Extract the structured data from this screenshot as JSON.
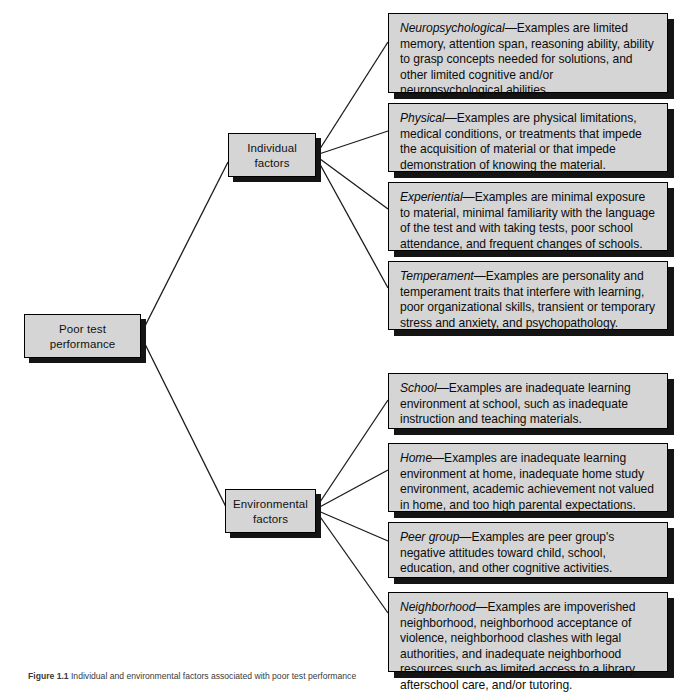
{
  "diagram": {
    "colors": {
      "box_fill": "#d5d5d5",
      "box_border": "#000000",
      "shadow": "#141414",
      "page_background": "#ffffff"
    },
    "root": {
      "id": "poor-test-performance",
      "label": "Poor test performance"
    },
    "branches": [
      {
        "id": "individual-factors",
        "label": "Individual factors",
        "details": [
          {
            "id": "neuropsychological",
            "term": "Neuropsychological",
            "dash": "—",
            "body": "Examples are limited memory, attention span, reasoning ability, ability to grasp concepts needed for solutions, and other limited cognitive and/or neuropsychological abilities."
          },
          {
            "id": "physical",
            "term": "Physical",
            "dash": "—",
            "body": "Examples are physical limitations, medical conditions, or treatments that impede the acquisition of material or that impede demonstration of knowing the material."
          },
          {
            "id": "experiential",
            "term": "Experiential",
            "dash": "—",
            "body": "Examples are minimal exposure to material, minimal familiarity with the language of the test and with taking tests, poor school attendance, and frequent changes of schools."
          },
          {
            "id": "temperament",
            "term": "Temperament",
            "dash": "—",
            "body": "Examples are personality and temperament traits that interfere with learning, poor organizational skills, transient or temporary stress and anxiety, and psychopathology."
          }
        ]
      },
      {
        "id": "environmental-factors",
        "label": "Environmental factors",
        "details": [
          {
            "id": "school",
            "term": "School",
            "dash": "—",
            "body": "Examples are inadequate learning environment at school, such as inadequate instruction and teaching materials."
          },
          {
            "id": "home",
            "term": "Home",
            "dash": "—",
            "body": "Examples are inadequate learning environment at home, inadequate home study environment, academic achievement not valued in home, and too high parental expectations."
          },
          {
            "id": "peer-group",
            "term": "Peer group",
            "dash": "—",
            "body": "Examples are peer group's negative attitudes toward child, school, education, and other cognitive activities."
          },
          {
            "id": "neighborhood",
            "term": "Neighborhood",
            "dash": "—",
            "body": "Examples are impoverished neighborhood, neighborhood acceptance of violence, neighborhood clashes with legal authorities, and inadequate neighborhood resources such as limited access to a library, afterschool care, and/or tutoring."
          }
        ]
      }
    ],
    "caption": {
      "label": "Figure 1.1",
      "text": "Individual and environmental factors associated with poor test performance"
    }
  }
}
